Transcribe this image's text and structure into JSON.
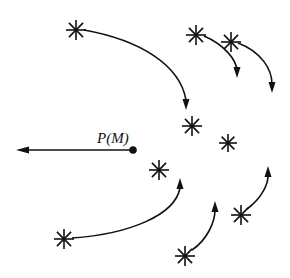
{
  "diagram": {
    "point_label": "P(M)",
    "colors": {
      "ink": "#111111",
      "background": "#ffffff"
    },
    "point": {
      "x": 133,
      "y": 150
    },
    "force_arrow": {
      "from": [
        133,
        150
      ],
      "to": [
        16,
        150
      ]
    },
    "stars": [
      {
        "id": "star-1",
        "x": 76,
        "y": 30,
        "r": 10
      },
      {
        "id": "star-2",
        "x": 196,
        "y": 35,
        "r": 10
      },
      {
        "id": "star-3",
        "x": 231,
        "y": 42,
        "r": 10
      },
      {
        "id": "star-4",
        "x": 192,
        "y": 126,
        "r": 10
      },
      {
        "id": "star-5",
        "x": 228,
        "y": 143,
        "r": 9
      },
      {
        "id": "star-6",
        "x": 159,
        "y": 170,
        "r": 10
      },
      {
        "id": "star-7",
        "x": 64,
        "y": 239,
        "r": 10
      },
      {
        "id": "star-8",
        "x": 241,
        "y": 215,
        "r": 10
      },
      {
        "id": "star-9",
        "x": 185,
        "y": 256,
        "r": 10
      }
    ],
    "trajectories": [
      {
        "id": "path-1",
        "d": "M 84 30 C 140 40 180 65 186 100",
        "tip": [
          186,
          110
        ],
        "dir": "down"
      },
      {
        "id": "path-2",
        "d": "M 204 36 C 225 45 236 60 237 70",
        "tip": [
          237,
          78
        ],
        "dir": "down"
      },
      {
        "id": "path-3",
        "d": "M 238 43 C 262 52 272 70 272 84",
        "tip": [
          272,
          93
        ],
        "dir": "down"
      },
      {
        "id": "path-7",
        "d": "M 72 238 C 130 234 175 215 180 188",
        "tip": [
          180,
          178
        ],
        "dir": "up"
      },
      {
        "id": "path-8",
        "d": "M 247 209 C 262 198 268 184 268 176",
        "tip": [
          268,
          166
        ],
        "dir": "up"
      },
      {
        "id": "path-9",
        "d": "M 192 250 C 207 240 215 222 215 210",
        "tip": [
          215,
          201
        ],
        "dir": "up"
      }
    ]
  }
}
